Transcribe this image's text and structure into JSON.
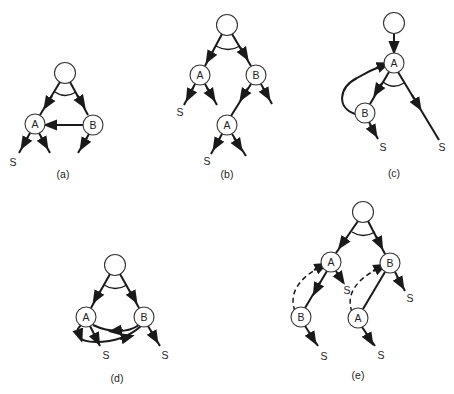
{
  "figure": {
    "panels": [
      {
        "id": "a",
        "caption": "(a)",
        "nodes": [
          {
            "id": "root",
            "label": ""
          },
          {
            "id": "A",
            "label": "A"
          },
          {
            "id": "B",
            "label": "B"
          }
        ],
        "terminals": [
          "S"
        ],
        "description": "AND-node root with children A and B; arc from B to A"
      },
      {
        "id": "b",
        "caption": "(b)",
        "nodes": [
          {
            "id": "root",
            "label": ""
          },
          {
            "id": "A",
            "label": "A"
          },
          {
            "id": "B",
            "label": "B"
          },
          {
            "id": "A2",
            "label": "A"
          }
        ],
        "terminals": [
          "S",
          "S"
        ],
        "description": "Unfolded tree: A under root, B under root with A child"
      },
      {
        "id": "c",
        "caption": "(c)",
        "nodes": [
          {
            "id": "root",
            "label": ""
          },
          {
            "id": "A",
            "label": "A"
          },
          {
            "id": "B",
            "label": "B"
          }
        ],
        "terminals": [
          "S",
          "S"
        ],
        "description": "Root to A; A AND-arc to B and S; loop from B back to A"
      },
      {
        "id": "d",
        "caption": "(d)",
        "nodes": [
          {
            "id": "root",
            "label": ""
          },
          {
            "id": "A",
            "label": "A"
          },
          {
            "id": "B",
            "label": "B"
          }
        ],
        "terminals": [
          "S",
          "S"
        ],
        "description": "AND-node root with A and B; mutual arcs between A and B"
      },
      {
        "id": "e",
        "caption": "(e)",
        "nodes": [
          {
            "id": "root",
            "label": ""
          },
          {
            "id": "A",
            "label": "A"
          },
          {
            "id": "B",
            "label": "B"
          },
          {
            "id": "B2",
            "label": "B"
          },
          {
            "id": "A2",
            "label": "A"
          }
        ],
        "terminals": [
          "S",
          "S",
          "S",
          "S"
        ],
        "description": "Unfolded tree with dashed back-arcs from lower B to A and lower A to B"
      }
    ]
  }
}
